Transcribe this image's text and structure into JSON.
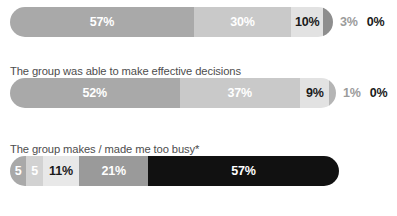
{
  "chart_data": {
    "type": "bar",
    "subtype": "stacked-horizontal-100pct",
    "title": "",
    "xlabel": "",
    "ylabel": "",
    "grid": false,
    "legend_position": "none",
    "xlim": [
      0,
      100
    ],
    "categories": [
      "",
      "The group was able to make effective decisions",
      "The group makes / made me too busy*"
    ],
    "series": [
      {
        "name": "Response 1",
        "values": [
          57,
          52,
          5
        ]
      },
      {
        "name": "Response 2",
        "values": [
          30,
          37,
          5
        ]
      },
      {
        "name": "Response 3",
        "values": [
          10,
          9,
          11
        ]
      },
      {
        "name": "Response 4",
        "values": [
          3,
          1,
          21
        ]
      },
      {
        "name": "Response 5",
        "values": [
          0,
          0,
          57
        ]
      }
    ]
  },
  "colors": {
    "background": "#ffffff",
    "label_text": "#4d4d4d",
    "dark_text": "#1a1a1a",
    "light_text": "#ffffff",
    "muted_text": "#9b9b9b",
    "gray_mid": "#a9a9a9",
    "gray_light": "#c9c9c9",
    "gray_lighter": "#e2e2e2",
    "gray_dark": "#8e8e8e",
    "black": "#111111"
  },
  "rows": [
    {
      "label": "",
      "has_label": false,
      "bar_width_px": 323,
      "segments": [
        {
          "value_label": "57%",
          "pct": 57,
          "color": "#a9a9a9",
          "text_color": "#ffffff",
          "show_label": true
        },
        {
          "value_label": "30%",
          "pct": 30,
          "color": "#c9c9c9",
          "text_color": "#ffffff",
          "show_label": true
        },
        {
          "value_label": "10%",
          "pct": 10,
          "color": "#e2e2e2",
          "text_color": "#1a1a1a",
          "show_label": true
        },
        {
          "value_label": "3%",
          "pct": 3,
          "color": "#8e8e8e",
          "text_color": "#ffffff",
          "show_label": false
        }
      ],
      "outside_labels": [
        {
          "text": "3%",
          "color": "#9b9b9b"
        },
        {
          "text": "0%",
          "color": "#1a1a1a"
        }
      ]
    },
    {
      "label": "The group was able to make effective decisions",
      "has_label": true,
      "bar_width_px": 326,
      "segments": [
        {
          "value_label": "52%",
          "pct": 52,
          "color": "#a9a9a9",
          "text_color": "#ffffff",
          "show_label": true
        },
        {
          "value_label": "37%",
          "pct": 37,
          "color": "#c9c9c9",
          "text_color": "#ffffff",
          "show_label": true
        },
        {
          "value_label": "9%",
          "pct": 9,
          "color": "#e2e2e2",
          "text_color": "#1a1a1a",
          "show_label": true
        },
        {
          "value_label": "1%",
          "pct": 2,
          "color": "#b5b5b5",
          "text_color": "#ffffff",
          "show_label": false
        }
      ],
      "outside_labels": [
        {
          "text": "1%",
          "color": "#9b9b9b"
        },
        {
          "text": "0%",
          "color": "#1a1a1a"
        }
      ]
    },
    {
      "label": "The group makes / made me too busy*",
      "has_label": true,
      "bar_width_px": 329,
      "segments": [
        {
          "value_label": "5",
          "pct": 5,
          "color": "#a9a9a9",
          "text_color": "#ffffff",
          "show_label": true
        },
        {
          "value_label": "5",
          "pct": 5,
          "color": "#d2d2d2",
          "text_color": "#ffffff",
          "show_label": true
        },
        {
          "value_label": "11%",
          "pct": 11,
          "color": "#e8e8e8",
          "text_color": "#1a1a1a",
          "show_label": true
        },
        {
          "value_label": "21%",
          "pct": 21,
          "color": "#9a9a9a",
          "text_color": "#ffffff",
          "show_label": true
        },
        {
          "value_label": "57%",
          "pct": 58,
          "color": "#111111",
          "text_color": "#ffffff",
          "show_label": true
        }
      ],
      "outside_labels": []
    }
  ]
}
